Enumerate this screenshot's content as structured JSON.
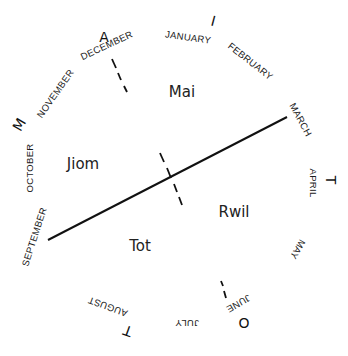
{
  "diagram": {
    "type": "circular-seasonal-calendar",
    "months": [
      {
        "label": "JANUARY",
        "x": 188,
        "y": 38,
        "rot": 8
      },
      {
        "label": "FEBRUARY",
        "x": 250,
        "y": 62,
        "rot": 38
      },
      {
        "label": "MARCH",
        "x": 300,
        "y": 120,
        "rot": 62
      },
      {
        "label": "APRIL",
        "x": 313,
        "y": 183,
        "rot": 90
      },
      {
        "label": "MAY",
        "x": 297,
        "y": 249,
        "rot": 120
      },
      {
        "label": "JUNE",
        "x": 238,
        "y": 303,
        "rot": 150
      },
      {
        "label": "JULY",
        "x": 187,
        "y": 323,
        "rot": 180
      },
      {
        "label": "AUGUST",
        "x": 108,
        "y": 306,
        "rot": 200
      },
      {
        "label": "SEPTEMBER",
        "x": 35,
        "y": 237,
        "rot": -72
      },
      {
        "label": "OCTOBER",
        "x": 30,
        "y": 168,
        "rot": -90
      },
      {
        "label": "NOVEMBER",
        "x": 56,
        "y": 94,
        "rot": -55
      },
      {
        "label": "DECEMBER",
        "x": 107,
        "y": 46,
        "rot": -25
      }
    ],
    "cardinal_letters": [
      {
        "label": "A",
        "x": 104,
        "y": 38,
        "rot": 0
      },
      {
        "label": "I",
        "x": 213,
        "y": 22,
        "rot": 15
      },
      {
        "label": "M",
        "x": 20,
        "y": 125,
        "rot": -60
      },
      {
        "label": "T",
        "x": 330,
        "y": 180,
        "rot": 90
      },
      {
        "label": "O",
        "x": 244,
        "y": 322,
        "rot": 180
      },
      {
        "label": "T",
        "x": 128,
        "y": 330,
        "rot": 200
      }
    ],
    "seasons": [
      {
        "label": "Mai",
        "x": 182,
        "y": 92
      },
      {
        "label": "Jiom",
        "x": 83,
        "y": 164
      },
      {
        "label": "Rwil",
        "x": 234,
        "y": 212
      },
      {
        "label": "Tot",
        "x": 140,
        "y": 246
      }
    ],
    "solid_axis": {
      "from": "SEPTEMBER",
      "to": "MARCH"
    },
    "dashed_axis": {
      "from": "DECEMBER",
      "to": "JUNE"
    }
  }
}
